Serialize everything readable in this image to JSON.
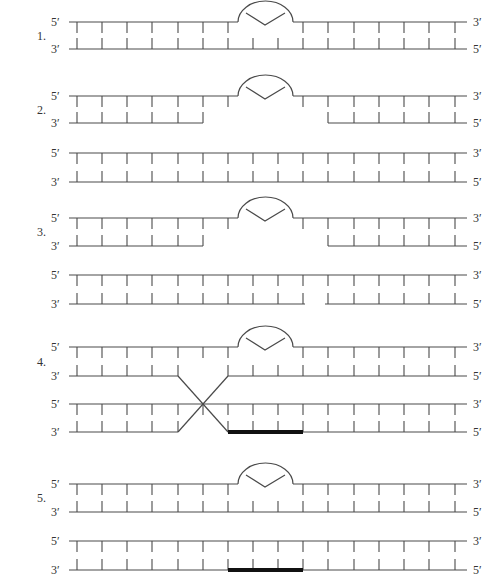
{
  "geometry": {
    "x_start": 69,
    "x_end": 467,
    "tick_x": [
      77,
      102,
      127,
      152,
      178,
      203,
      228,
      253,
      278,
      303,
      328,
      354,
      379,
      404,
      429,
      455
    ],
    "tick_half_len": 11,
    "bubble": {
      "x1": 238,
      "x2": 293,
      "height": 19,
      "v_left": 246,
      "v_apex": 265,
      "v_right": 285,
      "v_top_offset": 9,
      "v_apex_offset": 3
    },
    "label_left_x": 51,
    "label_right_x": 473,
    "step_x": 37
  },
  "steps": [
    {
      "number": "1.",
      "duplexes": [
        {
          "top_y": 22,
          "bottom_y": 49,
          "top_label": "5′",
          "bottom_label": "3′",
          "top_right_label": "3′",
          "bottom_right_label": "5′",
          "top_segments": [
            [
              69,
              238
            ],
            [
              293,
              467
            ]
          ],
          "bottom_segments": [
            [
              69,
              467
            ]
          ],
          "bubble": true,
          "top_missing_ticks": [
            253,
            278
          ],
          "bottom_missing_ticks": [],
          "thick": null,
          "crossover": false
        }
      ]
    },
    {
      "number": "2.",
      "duplexes": [
        {
          "top_y": 96,
          "bottom_y": 123,
          "top_label": "5′",
          "bottom_label": "3′",
          "top_right_label": "3′",
          "bottom_right_label": "5′",
          "top_segments": [
            [
              69,
              238
            ],
            [
              293,
              467
            ]
          ],
          "bottom_segments": [
            [
              69,
              203
            ],
            [
              328,
              467
            ]
          ],
          "bubble": true,
          "top_missing_ticks": [
            253,
            278
          ],
          "bottom_missing_ticks": [
            228,
            253,
            278,
            303
          ],
          "thick": null,
          "crossover": false
        },
        {
          "top_y": 153,
          "bottom_y": 182,
          "top_label": "5′",
          "bottom_label": "3′",
          "top_right_label": "3′",
          "bottom_right_label": "5′",
          "top_segments": [
            [
              69,
              467
            ]
          ],
          "bottom_segments": [
            [
              69,
              467
            ]
          ],
          "bubble": false,
          "top_missing_ticks": [],
          "bottom_missing_ticks": [],
          "thick": null,
          "crossover": false
        }
      ]
    },
    {
      "number": "3.",
      "duplexes": [
        {
          "top_y": 218,
          "bottom_y": 246,
          "top_label": "5′",
          "bottom_label": "3′",
          "top_right_label": "3′",
          "bottom_right_label": "5′",
          "top_segments": [
            [
              69,
              238
            ],
            [
              293,
              467
            ]
          ],
          "bottom_segments": [
            [
              69,
              203
            ],
            [
              328,
              467
            ]
          ],
          "bubble": true,
          "top_missing_ticks": [
            253,
            278
          ],
          "bottom_missing_ticks": [
            228,
            253,
            278,
            303
          ],
          "thick": null,
          "crossover": false
        },
        {
          "top_y": 275,
          "bottom_y": 304,
          "top_label": "5′",
          "bottom_label": "3′",
          "top_right_label": "3′",
          "bottom_right_label": "5′",
          "top_segments": [
            [
              69,
              467
            ]
          ],
          "bottom_segments": [
            [
              69,
              305
            ],
            [
              325,
              467
            ]
          ],
          "bubble": false,
          "top_missing_ticks": [],
          "bottom_missing_ticks": [],
          "thick": null,
          "crossover": false
        }
      ]
    },
    {
      "number": "4.",
      "duplexes": [
        {
          "top_y": 347,
          "bottom_y": 376,
          "top_label": "5′",
          "bottom_label": "3′",
          "top_right_label": "3′",
          "bottom_right_label": "5′",
          "top_segments": [
            [
              69,
              238
            ],
            [
              293,
              467
            ]
          ],
          "bottom_segments": [
            [
              69,
              178
            ],
            [
              228,
              467
            ]
          ],
          "bubble": true,
          "top_missing_ticks": [
            253,
            278
          ],
          "bottom_missing_ticks": [
            203
          ],
          "thick": null,
          "crossover": false
        },
        {
          "top_y": 404,
          "bottom_y": 432,
          "top_label": "5′",
          "bottom_label": "3′",
          "top_right_label": "3′",
          "bottom_right_label": "5′",
          "top_segments": [
            [
              69,
              467
            ]
          ],
          "bottom_segments": [
            [
              69,
              178
            ],
            [
              228,
              467
            ]
          ],
          "bubble": false,
          "top_missing_ticks": [],
          "bottom_missing_ticks": [
            203
          ],
          "thick": [
            228,
            303
          ],
          "crossover": true
        }
      ],
      "crossover": {
        "x1": 178,
        "x2": 228,
        "y_top": 376,
        "y_bottom": 432
      }
    },
    {
      "number": "5.",
      "duplexes": [
        {
          "top_y": 484,
          "bottom_y": 512,
          "top_label": "5′",
          "bottom_label": "3′",
          "top_right_label": "3′",
          "bottom_right_label": "5′",
          "top_segments": [
            [
              69,
              238
            ],
            [
              293,
              467
            ]
          ],
          "bottom_segments": [
            [
              69,
              467
            ]
          ],
          "bubble": true,
          "top_missing_ticks": [
            253,
            278
          ],
          "bottom_missing_ticks": [],
          "thick": null,
          "crossover": false
        },
        {
          "top_y": 541,
          "bottom_y": 570,
          "top_label": "5′",
          "bottom_label": "3′",
          "top_right_label": "3′",
          "bottom_right_label": "5′",
          "top_segments": [
            [
              69,
              467
            ]
          ],
          "bottom_segments": [
            [
              69,
              467
            ]
          ],
          "bubble": false,
          "top_missing_ticks": [],
          "bottom_missing_ticks": [],
          "thick": [
            228,
            303
          ],
          "crossover": false
        }
      ]
    }
  ]
}
